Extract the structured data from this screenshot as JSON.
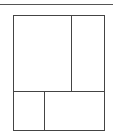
{
  "diagram": {
    "type": "layout-grid",
    "line_color": "#444444",
    "top_rule": {
      "y": 4,
      "x_start": 0,
      "x_end": 113
    },
    "box": {
      "x": 13,
      "y": 15,
      "width": 90,
      "height": 114
    },
    "rows": [
      {
        "name": "top-row",
        "height": 75,
        "cells": [
          {
            "name": "top-left-panel",
            "width": 58
          },
          {
            "name": "top-right-panel",
            "width": 32
          }
        ]
      },
      {
        "name": "bottom-row",
        "height": 39,
        "cells": [
          {
            "name": "bottom-left-panel",
            "width": 31
          },
          {
            "name": "bottom-right-panel",
            "width": 59
          }
        ]
      }
    ]
  }
}
